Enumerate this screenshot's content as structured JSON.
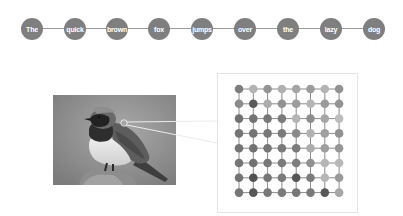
{
  "sequence": {
    "tokens": [
      "The",
      "quick",
      "brown",
      "fox",
      "jumps",
      "over",
      "the",
      "lazy",
      "dog"
    ],
    "node_color": "#7f7f7f",
    "text_color": "#ffffff",
    "line_color": "#9a9a9a"
  },
  "image": {
    "subject": "bird-photo",
    "mode": "grayscale",
    "highlight_point": {
      "x": 124,
      "y": 123
    }
  },
  "grid": {
    "rows": 8,
    "cols": 8,
    "line_color": "#8c8c8c",
    "shades": [
      [
        "#7e7e7e",
        "#b4b4b4",
        "#959595",
        "#b0b0b0",
        "#a4a4a4",
        "#9c9c9c",
        "#b4b4b4",
        "#929292"
      ],
      [
        "#8a8a8a",
        "#5a5a5a",
        "#adadad",
        "#929292",
        "#9c9c9c",
        "#b6b6b6",
        "#9a9a9a",
        "#949494"
      ],
      [
        "#707070",
        "#737373",
        "#777777",
        "#7a7a7a",
        "#b4b4b4",
        "#8e8e8e",
        "#a6a6a6",
        "#bcbcbc"
      ],
      [
        "#757575",
        "#747474",
        "#787878",
        "#7b7b7b",
        "#8a8a8a",
        "#b2b2b2",
        "#a0a0a0",
        "#929292"
      ],
      [
        "#747474",
        "#727272",
        "#777777",
        "#7a7a7a",
        "#7c7c7c",
        "#acacac",
        "#9e9e9e",
        "#969696"
      ],
      [
        "#767676",
        "#727272",
        "#787878",
        "#7b7b7b",
        "#7d7d7d",
        "#909090",
        "#b6b6b6",
        "#b8b8b8"
      ],
      [
        "#737373",
        "#525252",
        "#767676",
        "#7a7a7a",
        "#555555",
        "#7c7c7c",
        "#b6b6b6",
        "#9a9a9a"
      ],
      [
        "#777777",
        "#565656",
        "#787878",
        "#7b7b7b",
        "#777777",
        "#7a7a7a",
        "#585858",
        "#a6a6a6"
      ]
    ]
  }
}
